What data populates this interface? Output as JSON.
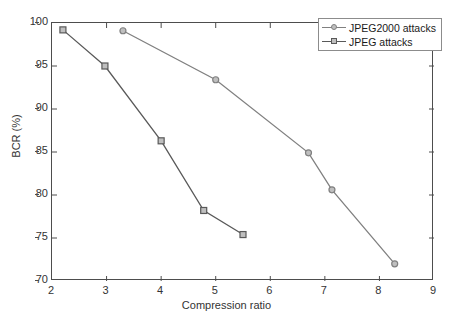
{
  "chart_data": {
    "type": "line",
    "title": "",
    "xlabel": "Compression ratio",
    "ylabel": "BCR (%)",
    "xlim": [
      2,
      9
    ],
    "ylim": [
      70,
      100
    ],
    "xticks": [
      2,
      3,
      4,
      5,
      6,
      7,
      8,
      9
    ],
    "yticks": [
      70,
      75,
      80,
      85,
      90,
      95,
      100
    ],
    "grid": false,
    "legend_position": "top-right",
    "series": [
      {
        "name": "JPEG2000 attacks",
        "marker": "circle",
        "color": "#808080",
        "x": [
          3.3,
          5.0,
          6.7,
          7.13,
          8.28
        ],
        "y": [
          99.1,
          93.4,
          84.9,
          80.6,
          72.0
        ]
      },
      {
        "name": "JPEG attacks",
        "marker": "square",
        "color": "#595959",
        "x": [
          2.2,
          2.97,
          4.0,
          4.78,
          5.5
        ],
        "y": [
          99.2,
          95.0,
          86.3,
          78.2,
          75.4
        ]
      }
    ]
  },
  "legend": {
    "entries": [
      {
        "label": "JPEG2000 attacks"
      },
      {
        "label": "JPEG attacks"
      }
    ]
  },
  "axes": {
    "x_tick_labels": [
      "2",
      "3",
      "4",
      "5",
      "6",
      "7",
      "8",
      "9"
    ],
    "y_tick_labels": [
      "70",
      "75",
      "80",
      "85",
      "90",
      "95",
      "100"
    ]
  }
}
